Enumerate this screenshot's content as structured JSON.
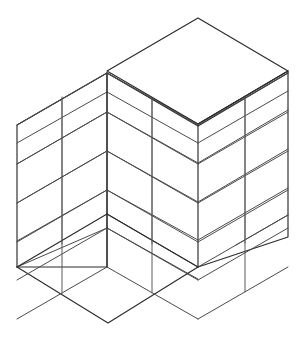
{
  "figure": {
    "title": "Isometric wireframe of an open shelving unit",
    "kind": "line-drawing",
    "projection": "isometric",
    "background_color": "#ffffff",
    "outline_color": "#2b2b2b",
    "shelf_line_color": "#4a4a4a",
    "divider_line_color": "#5a5a5a",
    "canvas": {
      "width": 305,
      "height": 340
    }
  },
  "geometry": {
    "description": "Open corner box: left wall, right wall, floor slab and solid top slab, seen in isometric view from above-front. Walls are subdivided into 5 horizontal shelf levels and each wall carries one vertical divider.",
    "vertices": {
      "top_apex": {
        "x": 198,
        "y": 18
      },
      "top_left_corner": {
        "x": 107,
        "y": 71
      },
      "top_right_corner": {
        "x": 288,
        "y": 71
      },
      "front_top": {
        "x": 107,
        "y": 73
      },
      "left_wall_top_back": {
        "x": 17,
        "y": 125
      },
      "left_wall_bottom_back": {
        "x": 17,
        "y": 267
      },
      "floor_front": {
        "x": 108,
        "y": 323
      },
      "floor_right": {
        "x": 198,
        "y": 267
      },
      "right_wall_bottom_back": {
        "x": 288,
        "y": 237
      },
      "inner_corner_top": {
        "x": 107,
        "y": 73
      },
      "inner_corner_bottom": {
        "x": 107,
        "y": 267
      }
    },
    "shelf_levels": 5,
    "shelf_line_y": [
      73,
      112,
      151,
      190,
      228,
      267
    ],
    "left_wall_divider_x": 62,
    "right_wall_divider_x": 245,
    "left_inner_divider_x": 152,
    "top_slab_thickness_px": 2
  },
  "labels": {
    "caption": "",
    "annotations": []
  }
}
